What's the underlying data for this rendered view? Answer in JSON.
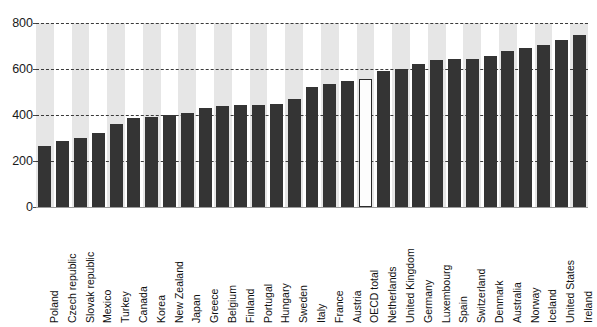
{
  "chart_data": {
    "type": "bar",
    "title": "",
    "subtitle": "",
    "xlabel": "",
    "ylabel": "",
    "ylim": [
      0,
      800
    ],
    "yticks": [
      0,
      200,
      400,
      600,
      800
    ],
    "ytick_labels": [
      "0",
      "200",
      "400",
      "600",
      "800"
    ],
    "grid": true,
    "gridline_style": "dashed-horizontal",
    "legend": null,
    "legend_position": "none",
    "bar_color": "#343434",
    "highlight_color": "#ffffff",
    "highlight_border_color": "#2b2b2b",
    "band_color": "#e6e6e6",
    "highlight_category": "OECD total",
    "categories": [
      "Poland",
      "Czech republic",
      "Slovak republic",
      "Mexico",
      "Turkey",
      "Canada",
      "Korea",
      "New Zealand",
      "Japan",
      "Greece",
      "Belgium",
      "Finland",
      "Portugal",
      "Hungary",
      "Sweden",
      "Italy",
      "France",
      "Austria",
      "OECD total",
      "Netherlands",
      "United Kingdom",
      "Germany",
      "Luxembourg",
      "Spain",
      "Switzerland",
      "Denmark",
      "Australia",
      "Norway",
      "Iceland",
      "United States",
      "Ireland"
    ],
    "values": [
      265,
      285,
      300,
      320,
      360,
      385,
      390,
      400,
      408,
      430,
      440,
      442,
      445,
      448,
      470,
      523,
      535,
      548,
      555,
      592,
      602,
      620,
      640,
      642,
      645,
      655,
      680,
      690,
      705,
      725,
      750
    ]
  }
}
